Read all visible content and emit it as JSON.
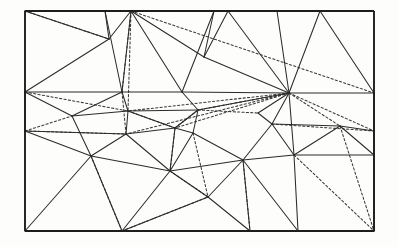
{
  "figure": {
    "background_color": "#fdfdfc",
    "solid_edge_color": "#2b2b2b",
    "dotted_edge_color": "#3a3a3a",
    "boundary_color": "#1d1d1d"
  },
  "chart_data": {
    "type": "diagram",
    "xlabel": "",
    "ylabel": "",
    "grid": false,
    "legend": "none",
    "domain_rect": {
      "x": 25,
      "y": 11,
      "width": 349,
      "height": 220
    },
    "vertex_count": 38,
    "vertices": [
      {
        "id": "v0",
        "x": 25,
        "y": 11,
        "label": "corner-top-left"
      },
      {
        "id": "v1",
        "x": 374,
        "y": 11,
        "label": "corner-top-right"
      },
      {
        "id": "v2",
        "x": 374,
        "y": 231,
        "label": "corner-bottom-right"
      },
      {
        "id": "v3",
        "x": 25,
        "y": 231,
        "label": "corner-bottom-left"
      },
      {
        "id": "v4",
        "x": 105,
        "y": 11,
        "label": "top-edge-a"
      },
      {
        "id": "v5",
        "x": 131,
        "y": 11,
        "label": "top-edge-hub"
      },
      {
        "id": "v6",
        "x": 214,
        "y": 11,
        "label": "top-edge-c"
      },
      {
        "id": "v7",
        "x": 228,
        "y": 11,
        "label": "top-edge-d"
      },
      {
        "id": "v8",
        "x": 277,
        "y": 11,
        "label": "top-edge-e"
      },
      {
        "id": "v9",
        "x": 320,
        "y": 11,
        "label": "top-edge-f"
      },
      {
        "id": "v10",
        "x": 25,
        "y": 92,
        "label": "left-edge-a"
      },
      {
        "id": "v11",
        "x": 25,
        "y": 131,
        "label": "left-edge-b"
      },
      {
        "id": "v12",
        "x": 374,
        "y": 93,
        "label": "right-edge-a"
      },
      {
        "id": "v13",
        "x": 374,
        "y": 131,
        "label": "right-edge-b"
      },
      {
        "id": "v14",
        "x": 374,
        "y": 155,
        "label": "right-edge-c"
      },
      {
        "id": "v15",
        "x": 122,
        "y": 231,
        "label": "bottom-edge-hub"
      },
      {
        "id": "v16",
        "x": 250,
        "y": 231,
        "label": "bottom-edge-b"
      },
      {
        "id": "v17",
        "x": 298,
        "y": 231,
        "label": "bottom-edge-c"
      },
      {
        "id": "v18",
        "x": 109,
        "y": 39,
        "label": "interior-upper-left"
      },
      {
        "id": "v19",
        "x": 204,
        "y": 57,
        "label": "interior-upper-mid"
      },
      {
        "id": "v20",
        "x": 122,
        "y": 92,
        "label": "interior-mid-left-hub"
      },
      {
        "id": "v21",
        "x": 182,
        "y": 92,
        "label": "interior-mid-center"
      },
      {
        "id": "v22",
        "x": 289,
        "y": 93,
        "label": "interior-right-hub"
      },
      {
        "id": "v23",
        "x": 72,
        "y": 116,
        "label": "interior-left-b"
      },
      {
        "id": "v24",
        "x": 128,
        "y": 111,
        "label": "interior-left-c"
      },
      {
        "id": "v25",
        "x": 198,
        "y": 110,
        "label": "interior-center-b"
      },
      {
        "id": "v26",
        "x": 175,
        "y": 128,
        "label": "interior-center-c"
      },
      {
        "id": "v27",
        "x": 126,
        "y": 134,
        "label": "interior-left-d"
      },
      {
        "id": "v28",
        "x": 193,
        "y": 133,
        "label": "interior-center-d"
      },
      {
        "id": "v29",
        "x": 272,
        "y": 124,
        "label": "interior-right-b"
      },
      {
        "id": "v30",
        "x": 340,
        "y": 126,
        "label": "interior-right-c"
      },
      {
        "id": "v31",
        "x": 91,
        "y": 156,
        "label": "interior-lower-left"
      },
      {
        "id": "v32",
        "x": 170,
        "y": 171,
        "label": "interior-lower-mid"
      },
      {
        "id": "v33",
        "x": 243,
        "y": 160,
        "label": "interior-lower-right"
      },
      {
        "id": "v34",
        "x": 294,
        "y": 155,
        "label": "interior-right-d"
      },
      {
        "id": "v35",
        "x": 208,
        "y": 197,
        "label": "interior-bottom-mid"
      },
      {
        "id": "v36",
        "x": 183,
        "y": 130,
        "label": "interior-center-e"
      },
      {
        "id": "v37",
        "x": 258,
        "y": 113,
        "label": "interior-right-e"
      }
    ],
    "edges_solid": [
      [
        "v0",
        "v18"
      ],
      [
        "v18",
        "v10"
      ],
      [
        "v4",
        "v18"
      ],
      [
        "v4",
        "v20"
      ],
      [
        "v5",
        "v18"
      ],
      [
        "v5",
        "v20"
      ],
      [
        "v5",
        "v19"
      ],
      [
        "v5",
        "v21"
      ],
      [
        "v6",
        "v19"
      ],
      [
        "v6",
        "v21"
      ],
      [
        "v7",
        "v19"
      ],
      [
        "v7",
        "v22"
      ],
      [
        "v8",
        "v22"
      ],
      [
        "v9",
        "v22"
      ],
      [
        "v9",
        "v12"
      ],
      [
        "v10",
        "v20"
      ],
      [
        "v10",
        "v23"
      ],
      [
        "v10",
        "v11"
      ],
      [
        "v20",
        "v21"
      ],
      [
        "v21",
        "v22"
      ],
      [
        "v22",
        "v12"
      ],
      [
        "v20",
        "v23"
      ],
      [
        "v20",
        "v24"
      ],
      [
        "v23",
        "v24"
      ],
      [
        "v23",
        "v31"
      ],
      [
        "v11",
        "v27"
      ],
      [
        "v11",
        "v31"
      ],
      [
        "v24",
        "v27"
      ],
      [
        "v24",
        "v26"
      ],
      [
        "v27",
        "v26"
      ],
      [
        "v27",
        "v31"
      ],
      [
        "v21",
        "v25"
      ],
      [
        "v25",
        "v26"
      ],
      [
        "v25",
        "v28"
      ],
      [
        "v26",
        "v28"
      ],
      [
        "v22",
        "v29"
      ],
      [
        "v29",
        "v30"
      ],
      [
        "v30",
        "v13"
      ],
      [
        "v29",
        "v34"
      ],
      [
        "v22",
        "v34"
      ],
      [
        "v30",
        "v34"
      ],
      [
        "v30",
        "v14"
      ],
      [
        "v14",
        "v34"
      ],
      [
        "v31",
        "v32"
      ],
      [
        "v31",
        "v15"
      ],
      [
        "v27",
        "v32"
      ],
      [
        "v32",
        "v33"
      ],
      [
        "v28",
        "v32"
      ],
      [
        "v28",
        "v33"
      ],
      [
        "v33",
        "v34"
      ],
      [
        "v33",
        "v35"
      ],
      [
        "v32",
        "v35"
      ],
      [
        "v15",
        "v32"
      ],
      [
        "v15",
        "v3"
      ],
      [
        "v35",
        "v16"
      ],
      [
        "v16",
        "v33"
      ],
      [
        "v17",
        "v33"
      ],
      [
        "v17",
        "v34"
      ],
      [
        "v2",
        "v14"
      ],
      [
        "v2",
        "v17"
      ],
      [
        "v22",
        "v25"
      ],
      [
        "v19",
        "v22"
      ],
      [
        "v26",
        "v32"
      ],
      [
        "v29",
        "v33"
      ],
      [
        "v13",
        "v14"
      ],
      [
        "v12",
        "v13"
      ],
      [
        "v24",
        "v25"
      ],
      [
        "v3",
        "v31"
      ],
      [
        "v15",
        "v35"
      ],
      [
        "v22",
        "v37"
      ],
      [
        "v37",
        "v29"
      ]
    ],
    "edges_dotted": [
      [
        "v0",
        "v18"
      ],
      [
        "v0",
        "v5"
      ],
      [
        "v5",
        "v12"
      ],
      [
        "v5",
        "v20"
      ],
      [
        "v5",
        "v24"
      ],
      [
        "v10",
        "v24"
      ],
      [
        "v11",
        "v23"
      ],
      [
        "v11",
        "v27"
      ],
      [
        "v20",
        "v27"
      ],
      [
        "v22",
        "v25"
      ],
      [
        "v22",
        "v26"
      ],
      [
        "v22",
        "v27"
      ],
      [
        "v25",
        "v37"
      ],
      [
        "v26",
        "v25"
      ],
      [
        "v28",
        "v35"
      ],
      [
        "v22",
        "v30"
      ],
      [
        "v29",
        "v13"
      ],
      [
        "v22",
        "v13"
      ],
      [
        "v34",
        "v2"
      ],
      [
        "v33",
        "v16"
      ],
      [
        "v31",
        "v15"
      ],
      [
        "v15",
        "v35"
      ],
      [
        "v35",
        "v32"
      ],
      [
        "v30",
        "v2"
      ],
      [
        "v26",
        "v32"
      ],
      [
        "v24",
        "v26"
      ],
      [
        "v22",
        "v24"
      ]
    ],
    "boundary_edges": [
      [
        "v0",
        "v1"
      ],
      [
        "v1",
        "v2"
      ],
      [
        "v2",
        "v3"
      ],
      [
        "v3",
        "v0"
      ]
    ]
  }
}
